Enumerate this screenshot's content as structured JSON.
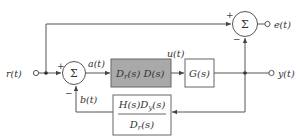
{
  "diagram": {
    "type": "block-diagram",
    "signals": {
      "input": "r(t)",
      "error_out": "e(t)",
      "output": "y(t)",
      "a": "a(t)",
      "u": "u(t)",
      "b": "b(t)"
    },
    "blocks": {
      "controller": {
        "label": "D_r(s) D(s)",
        "main1": "D",
        "sub1": "r",
        "rest1": "(s) ",
        "main2": "D(s)",
        "fill": "#a9a9a9"
      },
      "plant": {
        "label": "G(s)",
        "fill": "#ffffff"
      },
      "feedback": {
        "numerator": "H(s)D",
        "num_sub": "y",
        "num_tail": "(s)",
        "denominator": "D",
        "den_sub": "r",
        "den_tail": "(s)",
        "fill": "#ffffff"
      }
    },
    "summers": {
      "left": {
        "symbol": "Σ",
        "plus": "+",
        "minus": "−"
      },
      "right": {
        "symbol": "Σ",
        "plus": "+",
        "minus": "−"
      }
    }
  }
}
